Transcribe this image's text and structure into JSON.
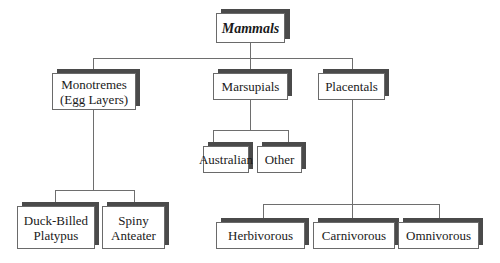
{
  "diagram": {
    "type": "tree",
    "root": {
      "label": "Mammals",
      "children": [
        {
          "label": "Monotremes\n(Egg Layers)",
          "children": [
            {
              "label": "Duck-Billed\nPlatypus"
            },
            {
              "label": "Spiny\nAnteater"
            }
          ]
        },
        {
          "label": "Marsupials",
          "children": [
            {
              "label": "Australian"
            },
            {
              "label": "Other"
            }
          ]
        },
        {
          "label": "Placentals",
          "children": [
            {
              "label": "Herbivorous"
            },
            {
              "label": "Carnivorous"
            },
            {
              "label": "Omnivorous"
            }
          ]
        }
      ]
    }
  },
  "nodes": {
    "mammals": "Mammals",
    "monotremes": "Monotremes\n(Egg Layers)",
    "marsupials": "Marsupials",
    "placentals": "Placentals",
    "australian": "Australian",
    "other": "Other",
    "duck_billed_platypus": "Duck-Billed\nPlatypus",
    "spiny_anteater": "Spiny\nAnteater",
    "herbivorous": "Herbivorous",
    "carnivorous": "Carnivorous",
    "omnivorous": "Omnivorous"
  },
  "colors": {
    "shadow": "#4a4a4a",
    "border": "#6a6a6a",
    "connector": "#6e6e6e",
    "background": "#ffffff"
  }
}
